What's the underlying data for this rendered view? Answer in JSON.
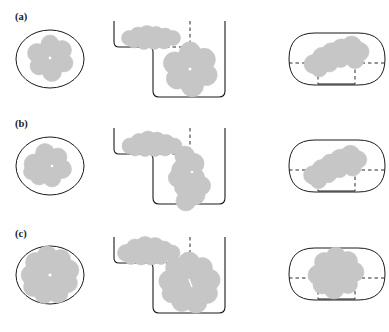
{
  "figure": {
    "type": "scientific-schematic",
    "background_color": "#ffffff",
    "blob_fill_color": "#c6c6c6",
    "blob_stroke_color": "#bdbdbd",
    "outline_color": "#1a1a1a",
    "dashed_color": "#2b2b2b",
    "rows": [
      {
        "label": "(a)",
        "panels": [
          {
            "name": "ellipse-panel",
            "shape": "ellipse",
            "blob_lobes": 6,
            "blob_size": "small",
            "has_center_dot": true
          },
          {
            "name": "step-well-panel",
            "shape": "stepped-well",
            "levels": 2,
            "upper_blob_shape": "flattened-chain",
            "lower_blob_lobes": 6,
            "lower_blob_has_center_dot": true,
            "dashed_guides": 2
          },
          {
            "name": "stadium-panel",
            "shape": "stadium",
            "blob_shape": "diagonal-chain",
            "dashed_guides": 4
          }
        ]
      },
      {
        "label": "(b)",
        "panels": [
          {
            "name": "ellipse-panel",
            "shape": "ellipse",
            "blob_lobes": 5,
            "blob_size": "medium",
            "has_center_dot": true
          },
          {
            "name": "step-well-panel",
            "shape": "stepped-well",
            "levels": 2,
            "upper_blob_shape": "flattened-chain",
            "lower_blob_lobes": 7,
            "lower_blob_has_center_dot": true,
            "dashed_guides": 2
          },
          {
            "name": "stadium-panel",
            "shape": "stadium",
            "blob_shape": "diagonal-chain",
            "dashed_guides": 4
          }
        ]
      },
      {
        "label": "(c)",
        "panels": [
          {
            "name": "ellipse-panel",
            "shape": "ellipse",
            "blob_lobes": 9,
            "blob_size": "large",
            "has_center_dot": true
          },
          {
            "name": "step-well-panel",
            "shape": "stepped-well",
            "levels": 2,
            "upper_blob_shape": "flattened-chain",
            "lower_blob_lobes": 9,
            "lower_blob_has_center_dot": true,
            "dashed_guides": 2
          },
          {
            "name": "stadium-panel",
            "shape": "stadium",
            "blob_shape": "large-lobed",
            "dashed_guides": 4
          }
        ]
      }
    ]
  }
}
